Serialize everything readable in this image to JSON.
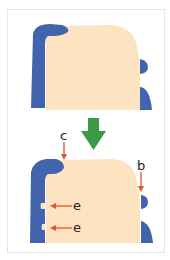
{
  "colors": {
    "enamel_blue": "#4264ad",
    "body_beige": "#fde3c0",
    "arrow_green": "#3a9a45",
    "pointer_red": "#e0542c",
    "frame_border": "#e3e6ea"
  },
  "panels": [
    {
      "id": "before",
      "labels": []
    },
    {
      "id": "after",
      "labels": [
        {
          "text": "c",
          "target": "top-left corner of blue band"
        },
        {
          "text": "b",
          "target": "small right blue bump"
        },
        {
          "text": "e",
          "target": "upper notch in left blue band"
        },
        {
          "text": "e",
          "target": "lower notch in left blue band"
        }
      ]
    }
  ],
  "arrow": {
    "direction": "down",
    "meaning": "transition"
  },
  "labels": {
    "c": "c",
    "b": "b",
    "e1": "e",
    "e2": "e"
  }
}
